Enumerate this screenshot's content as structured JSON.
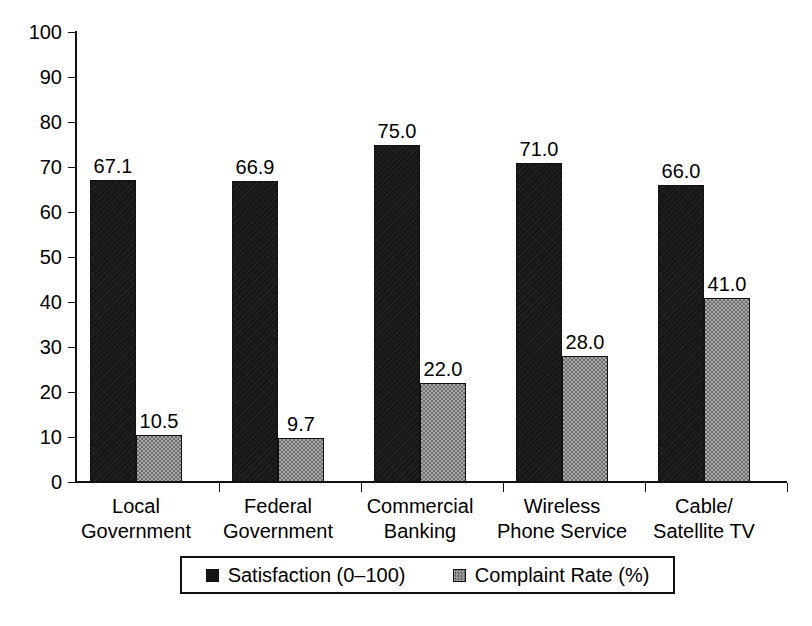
{
  "chart_data": {
    "type": "bar",
    "title": "",
    "xlabel": "",
    "ylabel": "",
    "ylim": [
      0,
      100
    ],
    "yticks": [
      0,
      10,
      20,
      30,
      40,
      50,
      60,
      70,
      80,
      90,
      100
    ],
    "grid": false,
    "legend_position": "bottom",
    "categories": [
      "Local\nGovernment",
      "Federal\nGovernment",
      "Commercial\nBanking",
      "Wireless\nPhone Service",
      "Cable/\nSatellite TV"
    ],
    "category_lines": [
      [
        "Local",
        "Government"
      ],
      [
        "Federal",
        "Government"
      ],
      [
        "Commercial",
        "Banking"
      ],
      [
        "Wireless",
        "Phone Service"
      ],
      [
        "Cable/",
        "Satellite TV"
      ]
    ],
    "series": [
      {
        "name": "Satisfaction (0–100)",
        "color": "#141414",
        "values": [
          67.1,
          66.9,
          75.0,
          71.0,
          66.0
        ],
        "labels": [
          "67.1",
          "66.9",
          "75.0",
          "71.0",
          "66.0"
        ]
      },
      {
        "name": "Complaint Rate (%)",
        "color": "#8a8a8a",
        "values": [
          10.5,
          9.7,
          22.0,
          28.0,
          41.0
        ],
        "labels": [
          "10.5",
          "9.7",
          "22.0",
          "28.0",
          "41.0"
        ]
      }
    ]
  },
  "axis": {
    "y_tick_labels": [
      "100",
      "90",
      "80",
      "70",
      "60",
      "50",
      "40",
      "30",
      "20",
      "10",
      "0"
    ]
  },
  "legend": {
    "entries": [
      {
        "label": "Satisfaction (0–100)",
        "swatch": "dark-square-swatch"
      },
      {
        "label": "Complaint Rate (%)",
        "swatch": "gray-square-swatch"
      }
    ]
  }
}
